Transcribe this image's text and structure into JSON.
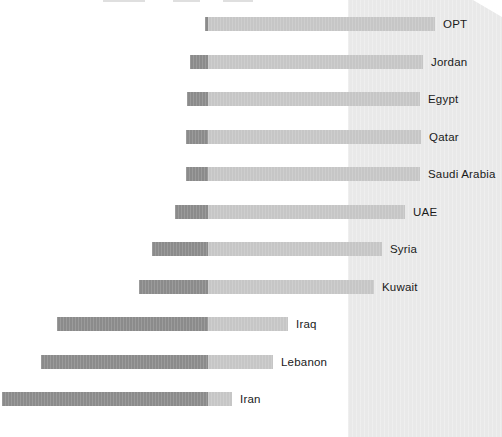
{
  "colors": {
    "background": "#ffffff",
    "shaded_panel": "#e9e9e9",
    "bar_dark": "#8b8b8b",
    "bar_light": "#c6c6c6",
    "label_text": "#1a1a1a"
  },
  "artifacts": {
    "top_cropped_text_remnants": [
      {
        "x": 103,
        "w": 42
      },
      {
        "x": 173,
        "w": 27
      },
      {
        "x": 223,
        "w": 30
      }
    ]
  },
  "chart_data": {
    "type": "bar",
    "orientation": "horizontal",
    "variant": "100% stacked bars aligned on a shared dark/light boundary (diverging)",
    "title": "",
    "xlabel": "",
    "ylabel": "",
    "legend": "none",
    "grid": false,
    "categories": [
      "OPT",
      "Jordan",
      "Egypt",
      "Qatar",
      "Saudi Arabia",
      "UAE",
      "Syria",
      "Kuwait",
      "Iraq",
      "Lebanon",
      "Iran"
    ],
    "series": [
      {
        "name": "dark_segment",
        "pct": [
          1,
          8,
          9,
          9,
          9,
          14,
          24,
          29,
          65,
          72,
          90
        ]
      },
      {
        "name": "light_segment",
        "pct": [
          99,
          92,
          91,
          91,
          91,
          86,
          76,
          71,
          35,
          28,
          10
        ]
      }
    ],
    "geometry_px": {
      "divider_x": 208,
      "bar_height": 14,
      "first_bar_top": 17,
      "row_pitch": 37.5,
      "dark_px": [
        3,
        18,
        21,
        22,
        22,
        33,
        56,
        69,
        151,
        167,
        206
      ],
      "light_px": [
        227,
        215,
        212,
        213,
        212,
        197,
        174,
        166,
        80,
        65,
        24
      ],
      "shaded_panel_x": 348,
      "label_gap": 8
    }
  }
}
